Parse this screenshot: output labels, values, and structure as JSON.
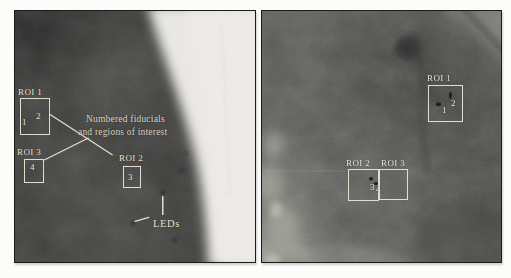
{
  "figure": {
    "panels": {
      "left": {
        "roi1": {
          "label": "ROI 1",
          "fid1": "1",
          "fid2": "2"
        },
        "roi2": {
          "label": "ROI 2",
          "fid3": "3"
        },
        "roi3": {
          "label": "ROI 3",
          "fid4": "4"
        },
        "note_line1": "Numbered fiducials",
        "note_line2": "and regions of interest",
        "leds_label": "LEDs"
      },
      "right": {
        "roi1": {
          "label": "ROI 1",
          "fid1": "1",
          "fid2": "2"
        },
        "roi2": {
          "label": "ROI 2",
          "fid3": "3"
        },
        "roi3": {
          "label": "ROI 3",
          "fid4": "4"
        }
      }
    },
    "colors": {
      "annotation_text": "#e9e2d0",
      "roi_box_border": "#eee8d8",
      "left_xray_base": "#3b3b39",
      "right_xray_base": "#585855",
      "bright_region": "#eceae5",
      "frame_border": "#1b1b19"
    }
  }
}
